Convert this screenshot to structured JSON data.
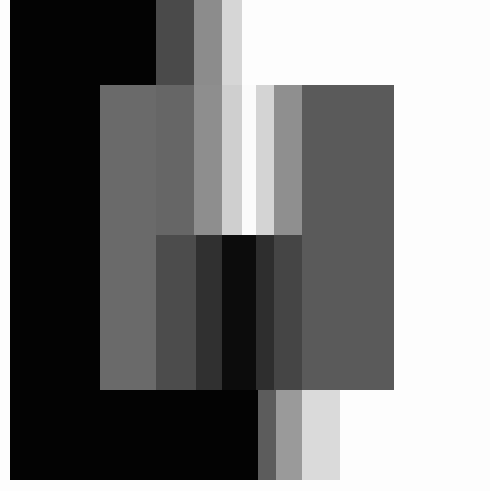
{
  "artwork": {
    "description": "Abstract geometric composition of overlapping grayscale rectangles and vertical gradient stripes",
    "background": "#fdfdfd",
    "blocks": [
      {
        "name": "black-field",
        "x": 10,
        "y": 0,
        "w": 146,
        "h": 480,
        "color": "#030303"
      },
      {
        "name": "black-field-lower",
        "x": 10,
        "y": 390,
        "w": 248,
        "h": 90,
        "color": "#030303"
      },
      {
        "name": "top-stripe-1",
        "x": 156,
        "y": 0,
        "w": 38,
        "h": 85,
        "color": "#4a4a4a"
      },
      {
        "name": "top-stripe-2",
        "x": 194,
        "y": 0,
        "w": 28,
        "h": 85,
        "color": "#8c8c8c"
      },
      {
        "name": "top-stripe-3",
        "x": 222,
        "y": 0,
        "w": 20,
        "h": 85,
        "color": "#d6d6d6"
      },
      {
        "name": "left-overlay-panel",
        "x": 100,
        "y": 85,
        "w": 56,
        "h": 305,
        "color": "#6a6a6a"
      },
      {
        "name": "mid-stripe-a",
        "x": 156,
        "y": 85,
        "w": 38,
        "h": 150,
        "color": "#666666"
      },
      {
        "name": "mid-stripe-b",
        "x": 194,
        "y": 85,
        "w": 28,
        "h": 150,
        "color": "#8e8e8e"
      },
      {
        "name": "mid-stripe-c",
        "x": 222,
        "y": 85,
        "w": 20,
        "h": 150,
        "color": "#cfcfcf"
      },
      {
        "name": "center-gap",
        "x": 242,
        "y": 85,
        "w": 14,
        "h": 150,
        "color": "#fbfbfb"
      },
      {
        "name": "right-stripe-1",
        "x": 256,
        "y": 85,
        "w": 18,
        "h": 150,
        "color": "#d4d4d4"
      },
      {
        "name": "right-stripe-2",
        "x": 274,
        "y": 85,
        "w": 28,
        "h": 150,
        "color": "#8f8f8f"
      },
      {
        "name": "right-panel",
        "x": 302,
        "y": 85,
        "w": 92,
        "h": 305,
        "color": "#5a5a5a"
      },
      {
        "name": "dark-band-1",
        "x": 156,
        "y": 235,
        "w": 40,
        "h": 155,
        "color": "#4c4c4c"
      },
      {
        "name": "dark-band-2",
        "x": 196,
        "y": 235,
        "w": 26,
        "h": 155,
        "color": "#303030"
      },
      {
        "name": "dark-band-3",
        "x": 222,
        "y": 235,
        "w": 34,
        "h": 155,
        "color": "#0c0c0c"
      },
      {
        "name": "dark-band-4",
        "x": 256,
        "y": 235,
        "w": 18,
        "h": 155,
        "color": "#2e2e2e"
      },
      {
        "name": "dark-band-5",
        "x": 274,
        "y": 235,
        "w": 28,
        "h": 155,
        "color": "#454545"
      },
      {
        "name": "bottom-stripe-1",
        "x": 258,
        "y": 390,
        "w": 18,
        "h": 90,
        "color": "#5c5c5c"
      },
      {
        "name": "bottom-stripe-2",
        "x": 276,
        "y": 390,
        "w": 26,
        "h": 90,
        "color": "#9a9a9a"
      },
      {
        "name": "bottom-stripe-3",
        "x": 302,
        "y": 390,
        "w": 38,
        "h": 90,
        "color": "#dadada"
      }
    ]
  }
}
